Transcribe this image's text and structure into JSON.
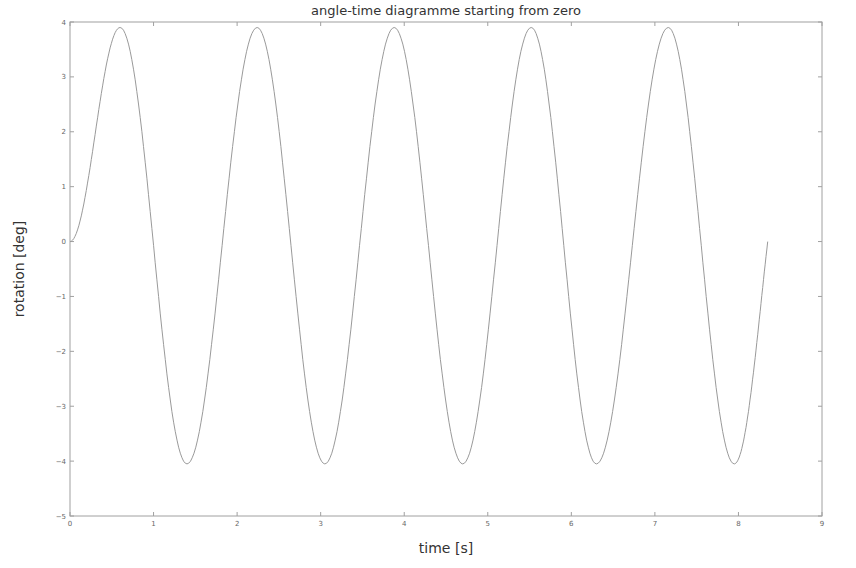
{
  "chart_data": {
    "type": "line",
    "title": "angle-time diagramme starting from zero",
    "xlabel": "time [s]",
    "ylabel": "rotation [deg]",
    "xlim": [
      0,
      9
    ],
    "ylim": [
      -5,
      4
    ],
    "xticks": [
      0,
      1,
      2,
      3,
      4,
      5,
      6,
      7,
      8,
      9
    ],
    "yticks": [
      4,
      3,
      2,
      1,
      0,
      -1,
      -2,
      -3,
      -4,
      -5
    ],
    "grid": false,
    "legend": null,
    "line_color": "#9a9a9a",
    "series": [
      {
        "name": "rotation",
        "description": "oscillation starting from rest at 0, amplitude ~ +3.9 / -4.05, period ~1.64 s, ends near 0 at t~8.35",
        "peaks": [
          [
            0.6,
            3.9
          ],
          [
            2.24,
            3.9
          ],
          [
            3.88,
            3.9
          ],
          [
            5.52,
            3.9
          ],
          [
            7.16,
            3.9
          ]
        ],
        "troughs": [
          [
            1.4,
            -4.05
          ],
          [
            3.05,
            -4.05
          ],
          [
            4.7,
            -4.05
          ],
          [
            6.3,
            -4.05
          ],
          [
            7.95,
            -4.05
          ]
        ],
        "x": [
          0,
          0.1,
          0.2,
          0.3,
          0.4,
          0.5,
          0.6,
          0.8,
          1.0,
          1.2,
          1.4,
          1.6,
          1.8,
          2.0,
          2.24,
          2.4,
          2.6,
          2.8,
          3.05,
          3.2,
          3.4,
          3.6,
          3.88,
          4.0,
          4.2,
          4.4,
          4.7,
          4.9,
          5.1,
          5.3,
          5.52,
          5.7,
          5.9,
          6.1,
          6.3,
          6.5,
          6.7,
          6.9,
          7.16,
          7.3,
          7.5,
          7.7,
          7.95,
          8.1,
          8.25,
          8.35
        ],
        "y": [
          0,
          0.3,
          1.1,
          2.2,
          3.2,
          3.75,
          3.9,
          3.1,
          0.8,
          -2.1,
          -4.05,
          -3.0,
          -0.4,
          2.0,
          3.9,
          3.4,
          1.5,
          -1.4,
          -4.05,
          -3.6,
          -1.6,
          1.2,
          3.9,
          3.7,
          2.2,
          -0.3,
          -4.05,
          -3.2,
          -1.0,
          1.6,
          3.9,
          3.6,
          1.9,
          -0.9,
          -4.05,
          -3.0,
          -0.7,
          1.8,
          3.9,
          3.6,
          2.0,
          -0.7,
          -4.05,
          -3.3,
          -1.6,
          0.0
        ]
      }
    ]
  }
}
